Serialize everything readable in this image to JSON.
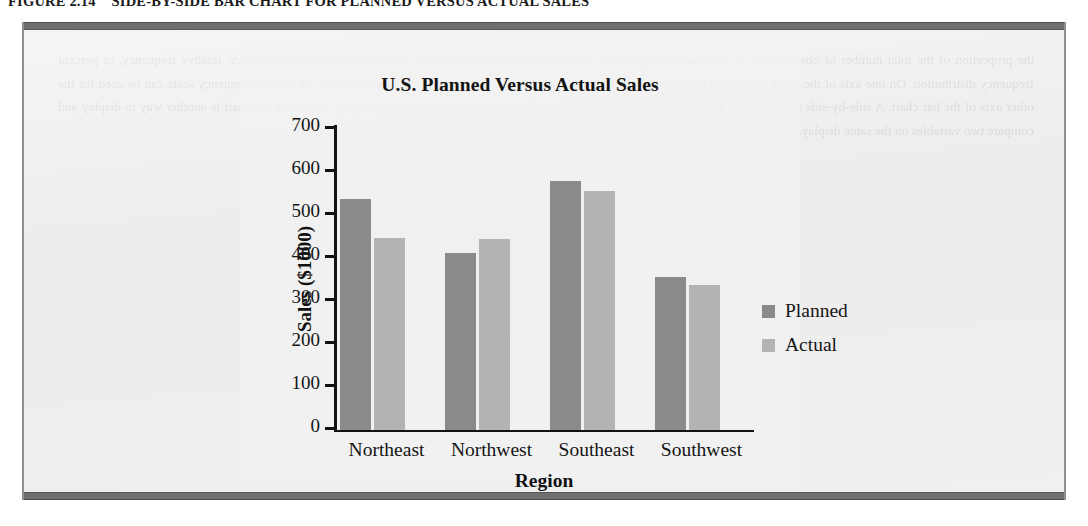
{
  "figure": {
    "number": "FIGURE 2.14",
    "caption": "SIDE-BY-SIDE BAR CHART FOR PLANNED VERSUS ACTUAL SALES",
    "panel_background": "#e9e9e9",
    "rule_color": "#6f6f70",
    "ghost_text": "the proportion of the total number of observations. A bar chart is a graphical display for depicting qualitative data summarized in a frequency, relative frequency, or percent frequency distribution. On one axis of the chart we specify the labels that are used for the classes. A frequency, relative frequency, or percent frequency scale can be used for the other axis of the bar chart. A side-by-side bar chart is a graphical display for depicting multiple bar charts on the same display. A stacked bar chart is another way to display and compare two variables on the same display."
  },
  "chart_data": {
    "type": "bar",
    "title": "U.S. Planned Versus Actual Sales",
    "xlabel": "Region",
    "ylabel": "Sales ($1000)",
    "categories": [
      "Northeast",
      "Northwest",
      "Southeast",
      "Southwest"
    ],
    "series": [
      {
        "name": "Planned",
        "color": "#8a8a8a",
        "values": [
          537,
          410,
          578,
          354
        ]
      },
      {
        "name": "Actual",
        "color": "#b3b3b3",
        "values": [
          446,
          444,
          554,
          335
        ]
      }
    ],
    "ylim": [
      0,
      700
    ],
    "ytick_labels": [
      "700",
      "600",
      "500",
      "400",
      "300",
      "200",
      "100",
      "0"
    ],
    "ytick_values": [
      700,
      600,
      500,
      400,
      300,
      200,
      100,
      0
    ],
    "grid": false,
    "legend_position": "right"
  }
}
